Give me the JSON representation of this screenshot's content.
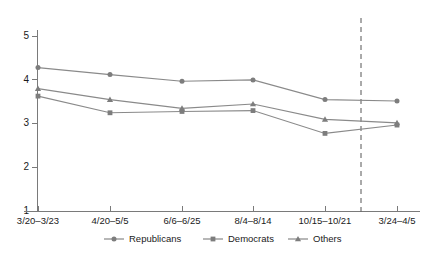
{
  "chart_data": {
    "type": "line",
    "title": "",
    "subtitle": "",
    "xlabel": "",
    "ylabel": "",
    "categories": [
      "3/20–3/23",
      "4/20–5/5",
      "6/6–6/25",
      "8/4–8/14",
      "10/15–10/21",
      "3/24–4/5"
    ],
    "ylim": [
      1,
      5
    ],
    "yticks": [
      1,
      2,
      3,
      4,
      5
    ],
    "ytick_labels": [
      "1",
      "2",
      "3",
      "4",
      "5"
    ],
    "grid": false,
    "legend_position": "bottom",
    "series": [
      {
        "name": "Republicans",
        "marker": "circle",
        "color": "#7d7d7d",
        "values": [
          4.28,
          4.12,
          3.97,
          4.0,
          3.55,
          3.52
        ]
      },
      {
        "name": "Democrats",
        "marker": "square",
        "color": "#7d7d7d",
        "values": [
          3.63,
          3.25,
          3.28,
          3.3,
          2.78,
          2.97
        ]
      },
      {
        "name": "Others",
        "marker": "triangle",
        "color": "#7d7d7d",
        "values": [
          3.8,
          3.55,
          3.35,
          3.45,
          3.1,
          3.02
        ]
      }
    ],
    "annotations": [
      {
        "type": "vertical-dashed-line",
        "name": "reference-divider",
        "between_categories": [
          4,
          5
        ],
        "color": "#555555"
      }
    ]
  },
  "legend": {
    "entries": [
      {
        "label": "Republicans",
        "marker": "circle"
      },
      {
        "label": "Democrats",
        "marker": "square"
      },
      {
        "label": "Others",
        "marker": "triangle"
      }
    ]
  }
}
